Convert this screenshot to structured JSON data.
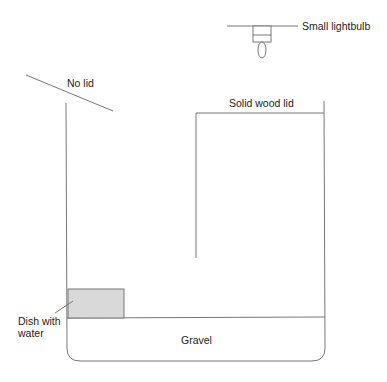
{
  "diagram": {
    "type": "terrarium setup",
    "labels": {
      "lightbulb": "Small lightbulb",
      "no_lid": "No lid",
      "wood_lid": "Solid wood lid",
      "dish_line1": "Dish with",
      "dish_line2": "water",
      "gravel": "Gravel"
    },
    "colors": {
      "line": "#777777",
      "dish_fill": "#d9d9d9",
      "text": "#222222"
    }
  }
}
